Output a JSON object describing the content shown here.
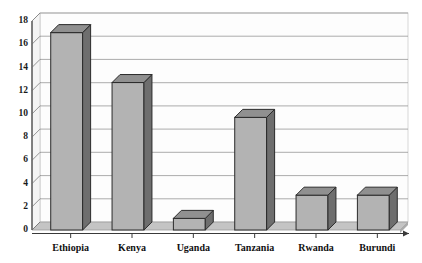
{
  "chart_data": {
    "type": "bar",
    "title": "",
    "subtitle": "",
    "xlabel": "",
    "ylabel": "",
    "categories": [
      "Ethiopia",
      "Kenya",
      "Uganda",
      "Tanzania",
      "Rwanda",
      "Burundi"
    ],
    "values": [
      17,
      12.7,
      1,
      9.7,
      3,
      3
    ],
    "ylim": [
      0,
      18
    ],
    "ytick_step": 2,
    "yticks": [
      "0",
      "2",
      "4",
      "6",
      "8",
      "10",
      "12",
      "14",
      "16",
      "18"
    ],
    "grid": true,
    "grid_axis": "y",
    "legend": false,
    "legend_position": "none",
    "style": "3d-bar",
    "colors": {
      "bar_front": "#b3b3b3",
      "bar_side": "#6e6e6e",
      "bar_top": "#909090",
      "bar_outline": "#2b2b2b",
      "gridline": "#808080",
      "axis": "#3a3a3a",
      "wall": "#fbfbfb",
      "wall_edge": "#c9c9c9",
      "floor": "#c2c2c2",
      "floor_side": "#a8a8a8",
      "background": "#ffffff",
      "text": "#111111"
    }
  }
}
